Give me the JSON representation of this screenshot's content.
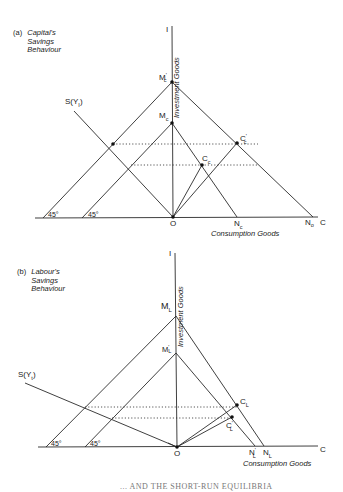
{
  "figure": {
    "caption_partial": "... AND THE SHORT-RUN EQUILIBRIA",
    "panels": [
      {
        "id": "a",
        "tag": "(a)",
        "title_lines": [
          "Capital's",
          "Savings",
          "Behaviour"
        ],
        "axis_y_label": "I",
        "axis_y_title": "Investment Goods",
        "axis_x_label": "C",
        "axis_x_title": "Consumption Goods",
        "origin_label": "O",
        "savings_curve_label": "S(Y",
        "savings_curve_sub": "I",
        "angle_labels": [
          "45°",
          "45°"
        ],
        "points": {
          "M_prime": {
            "label": "M",
            "sub": "c",
            "prime": "'"
          },
          "M": {
            "label": "M",
            "sub": "c"
          },
          "N": {
            "label": "N",
            "sub": "c"
          },
          "N_prime": {
            "label": "N",
            "sub": "o"
          },
          "C_prime": {
            "label": "C",
            "sub": "c",
            "prime": "'"
          },
          "C": {
            "label": "C",
            "sub": "c"
          }
        }
      },
      {
        "id": "b",
        "tag": "(b)",
        "title_lines": [
          "Labour's",
          "Savings",
          "Behaviour"
        ],
        "axis_y_label": "I",
        "axis_y_title": "Investment Goods",
        "axis_x_label": "C",
        "axis_x_title": "Consumption Goods",
        "origin_label": "O",
        "savings_curve_label": "S(Y",
        "savings_curve_sub": "t",
        "angle_labels": [
          "45°",
          "45°"
        ],
        "points": {
          "M": {
            "label": "M",
            "sub": "L"
          },
          "M_prime": {
            "label": "M",
            "sub": "L",
            "prime": "'"
          },
          "N": {
            "label": "N",
            "sub": "L"
          },
          "N_prime": {
            "label": "N",
            "sub": "L",
            "prime": "'"
          },
          "C": {
            "label": "C",
            "sub": "L"
          },
          "C_prime": {
            "label": "C",
            "sub": "L",
            "prime": "'"
          }
        }
      }
    ]
  }
}
